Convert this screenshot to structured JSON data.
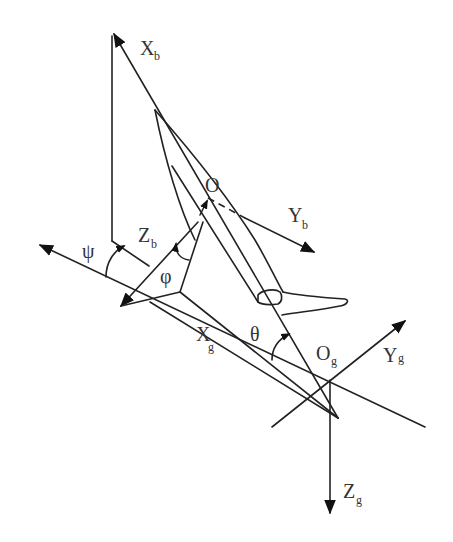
{
  "diagram": {
    "labels": {
      "xb": {
        "main": "X",
        "sub": "b"
      },
      "yb": {
        "main": "Y",
        "sub": "b"
      },
      "zb": {
        "main": "Z",
        "sub": "b"
      },
      "o": {
        "main": "O"
      },
      "xg": {
        "main": "X",
        "sub": "g"
      },
      "yg": {
        "main": "Y",
        "sub": "g"
      },
      "zg": {
        "main": "Z",
        "sub": "g"
      },
      "og": {
        "main": "O",
        "sub": "g"
      },
      "psi": "ψ",
      "phi": "φ",
      "theta": "θ"
    },
    "colors": {
      "stroke": "#222222",
      "text": "#333333",
      "background": "#ffffff"
    }
  }
}
